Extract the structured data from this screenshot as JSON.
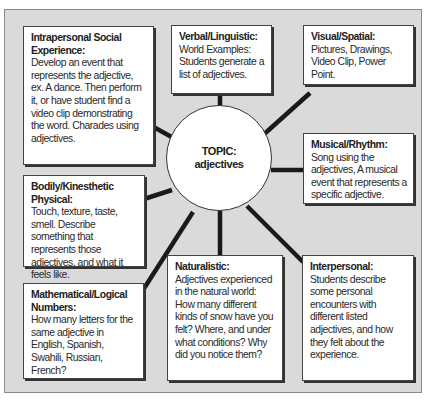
{
  "center": {
    "line1": "TOPIC:",
    "line2": "adjectives"
  },
  "boxes": {
    "intrapersonal": {
      "title": "Intrapersonal Social Experience:",
      "body": "Develop an event that represents the adjective, ex. A dance. Then perform it, or have student find a video clip demonstrating the word. Charades using adjectives."
    },
    "verbal": {
      "title": "Verbal/Linguistic:",
      "body": "World Examples: Students generate a list of adjectives."
    },
    "visual": {
      "title": "Visual/Spatial:",
      "body": "Pictures, Drawings, Video Clip, Power Point."
    },
    "musical": {
      "title": "Musical/Rhythm:",
      "body": "Song using the adjectives, A musical event that represents a specific adjective."
    },
    "bodily": {
      "title": "Bodily/Kinesthetic Physical:",
      "body": "Touch, texture, taste, smell. Describe something that represents those adjectives, and what it feels like."
    },
    "mathematical": {
      "title": "Mathematical/Logical Numbers:",
      "body": "How many letters for the same adjective in English, Spanish, Swahili, Russian, French?"
    },
    "naturalistic": {
      "title": "Naturalistic:",
      "body": "Adjectives experienced in the natural world: How many different kinds of snow have you felt? Where, and under what conditions? Why did you notice them?"
    },
    "interpersonal": {
      "title": "Interpersonal:",
      "body": "Students describe some personal encounters with different listed adjectives, and how they felt about the experience."
    }
  },
  "colors": {
    "background": "#dadada",
    "box_fill": "#ffffff",
    "line": "#1a1a1a",
    "text": "#2a2a2a"
  }
}
